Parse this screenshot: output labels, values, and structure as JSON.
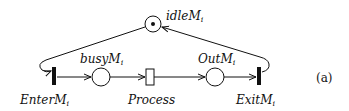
{
  "diagram": {
    "type": "petri-net",
    "caption": "(a)",
    "places": [
      {
        "id": "idle",
        "name": "idle",
        "sub": "M",
        "idx": "i",
        "tokens": 1
      },
      {
        "id": "busy",
        "name": "busy",
        "sub": "M",
        "idx": "i",
        "tokens": 0
      },
      {
        "id": "out",
        "name": "Out",
        "sub": "M",
        "idx": "i",
        "tokens": 0
      }
    ],
    "transitions": [
      {
        "id": "enter",
        "name": "Enter",
        "sub": "M",
        "idx": "i",
        "kind": "immediate"
      },
      {
        "id": "process",
        "name": "Process",
        "kind": "timed"
      },
      {
        "id": "exit",
        "name": "Exit",
        "sub": "M",
        "idx": "i",
        "kind": "immediate"
      }
    ],
    "arcs": [
      {
        "from": "idle",
        "to": "enter"
      },
      {
        "from": "enter",
        "to": "busy"
      },
      {
        "from": "busy",
        "to": "process"
      },
      {
        "from": "process",
        "to": "out"
      },
      {
        "from": "out",
        "to": "exit"
      },
      {
        "from": "exit",
        "to": "idle"
      }
    ]
  }
}
